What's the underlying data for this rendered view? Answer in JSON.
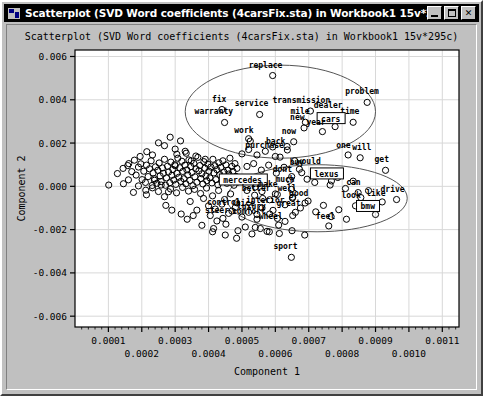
{
  "window": {
    "title": "Scatterplot (SVD Word coefficients (4carsFix.sta) in Workbook1 15v*295c)*",
    "icon": "statistica-graph-icon",
    "buttons": {
      "minimize": "minimize-button",
      "maximize": "maximize-button",
      "close_label": "✕"
    }
  },
  "chart_data": {
    "type": "scatter",
    "title": "Scatterplot (SVD Word coefficients (4carsFix.sta) in Workbook1 15v*295c)",
    "xlabel": "Component 1",
    "ylabel": "Component 2",
    "xlim": [
      0.0,
      0.00115
    ],
    "ylim": [
      -0.0065,
      0.0063
    ],
    "grid": true,
    "legend": "none",
    "xticks": [
      "0.0001",
      "0.0002",
      "0.0003",
      "0.0004",
      "0.0005",
      "0.0006",
      "0.0007",
      "0.0008",
      "0.0009",
      "0.0010",
      "0.0011"
    ],
    "xtick_values": [
      0.0001,
      0.0002,
      0.0003,
      0.0004,
      0.0005,
      0.0006,
      0.0007,
      0.0008,
      0.0009,
      0.001,
      0.0011
    ],
    "yticks": [
      "0.006",
      "0.004",
      "0.002",
      "0.000",
      "-0.002",
      "-0.004",
      "-0.006"
    ],
    "ytick_values": [
      0.006,
      0.004,
      0.002,
      0.0,
      -0.002,
      -0.004,
      -0.006
    ],
    "marker": "open-circle",
    "marker_color": "#000000",
    "plot_bg": "#ffffff",
    "annotations": {
      "ellipses": [
        {
          "name": "upper-ellipse",
          "cx": 0.000615,
          "cy": 0.00345,
          "rx": 0.000285,
          "ry": 0.00215,
          "rotation": 0
        },
        {
          "name": "lower-ellipse",
          "cx": 0.000725,
          "cy": -0.00055,
          "rx": 0.00027,
          "ry": 0.00155,
          "rotation": 0
        }
      ],
      "boxed_labels": [
        "cars",
        "lexus",
        "mercedes",
        "bmw"
      ]
    },
    "labeled_points": [
      {
        "label": "replace",
        "x": 0.000592,
        "y": 0.00512,
        "lx": -24,
        "ly": -8
      },
      {
        "label": "problem",
        "x": 0.000875,
        "y": 0.00388,
        "lx": -22,
        "ly": -8
      },
      {
        "label": "fix",
        "x": 0.00044,
        "y": 0.00355,
        "lx": -10,
        "ly": -8
      },
      {
        "label": "transmission",
        "x": 0.000705,
        "y": 0.00348,
        "lx": -38,
        "ly": -8
      },
      {
        "label": "service",
        "x": 0.000553,
        "y": 0.00332,
        "lx": -25,
        "ly": -8
      },
      {
        "label": "dealer",
        "x": 0.000775,
        "y": 0.00325,
        "lx": -20,
        "ly": -8
      },
      {
        "label": "warranty",
        "x": 0.000448,
        "y": 0.00295,
        "lx": -30,
        "ly": -8
      },
      {
        "label": "time",
        "x": 0.000833,
        "y": 0.00296,
        "lx": -13,
        "ly": -8
      },
      {
        "label": "mile",
        "x": 0.00069,
        "y": 0.00296,
        "lx": -15,
        "ly": -8
      },
      {
        "label": "new",
        "x": 0.000686,
        "y": 0.0027,
        "lx": -14,
        "ly": -8
      },
      {
        "label": "cars",
        "x": 0.000779,
        "y": 0.00276,
        "lx": -14,
        "ly": -5,
        "boxed": true
      },
      {
        "label": "year",
        "x": 0.000741,
        "y": 0.00253,
        "lx": -16,
        "ly": -7
      },
      {
        "label": "work",
        "x": 0.000525,
        "y": 0.00209,
        "lx": -16,
        "ly": -8
      },
      {
        "label": "now",
        "x": 0.000655,
        "y": 0.00206,
        "lx": -12,
        "ly": -8
      },
      {
        "label": "back",
        "x": 0.000635,
        "y": 0.00184,
        "lx": -21,
        "ly": -3
      },
      {
        "label": "one",
        "x": 0.000818,
        "y": 0.00145,
        "lx": -12,
        "ly": -7
      },
      {
        "label": "will",
        "x": 0.000854,
        "y": 0.00132,
        "lx": -8,
        "ly": -8
      },
      {
        "label": "purchase",
        "x": 0.0006,
        "y": 0.00138,
        "lx": -30,
        "ly": -8
      },
      {
        "label": "would",
        "x": 0.000718,
        "y": 0.00068,
        "lx": -18,
        "ly": -8
      },
      {
        "label": "buy",
        "x": 0.000679,
        "y": 0.00063,
        "lx": -12,
        "ly": -8
      },
      {
        "label": "get",
        "x": 0.00093,
        "y": 0.00074,
        "lx": -11,
        "ly": -8
      },
      {
        "label": "dont",
        "x": 0.000643,
        "y": 0.00028,
        "lx": -17,
        "ly": -8
      },
      {
        "label": "lexus",
        "x": 0.000768,
        "y": 0.00025,
        "lx": -17,
        "ly": -4,
        "boxed": true
      },
      {
        "label": "mercedes",
        "x": 0.00054,
        "y": -3e-05,
        "lx": -32,
        "ly": -4,
        "boxed": true
      },
      {
        "label": "much",
        "x": 0.000648,
        "y": -0.00014,
        "lx": -16,
        "ly": -7
      },
      {
        "label": "can",
        "x": 0.000848,
        "y": -0.00029,
        "lx": -12,
        "ly": -8
      },
      {
        "label": "make",
        "x": 0.0006,
        "y": -0.00035,
        "lx": -17,
        "ly": -7
      },
      {
        "label": "well",
        "x": 0.000651,
        "y": -0.00054,
        "lx": -15,
        "ly": -7
      },
      {
        "label": "better",
        "x": 0.000562,
        "y": -0.00056,
        "lx": -21,
        "ly": -7
      },
      {
        "label": "good",
        "x": 0.000689,
        "y": -0.00077,
        "lx": -16,
        "ly": -7
      },
      {
        "label": "look",
        "x": 0.00084,
        "y": -0.0009,
        "lx": -14,
        "ly": -8
      },
      {
        "label": "like",
        "x": 0.00092,
        "y": -0.00072,
        "lx": -16,
        "ly": -6
      },
      {
        "label": "drive",
        "x": 0.000963,
        "y": -0.00061,
        "lx": -16,
        "ly": -8
      },
      {
        "label": "interior",
        "x": 0.000593,
        "y": -0.00111,
        "lx": -27,
        "ly": -7
      },
      {
        "label": "great",
        "x": 0.00066,
        "y": -0.0012,
        "lx": -19,
        "ly": -6
      },
      {
        "label": "bmw",
        "x": 0.0009,
        "y": -0.0013,
        "lx": -15,
        "ly": -5,
        "boxed": true
      },
      {
        "label": "control",
        "x": 0.00047,
        "y": -0.00114,
        "lx": -25,
        "ly": -6
      },
      {
        "label": "nice",
        "x": 0.00052,
        "y": -0.0012,
        "lx": -13,
        "ly": -6
      },
      {
        "label": "luxury",
        "x": 0.000545,
        "y": -0.0013,
        "lx": -20,
        "ly": -5
      },
      {
        "label": "comfort",
        "x": 0.000545,
        "y": -0.00152,
        "lx": -25,
        "ly": -5
      },
      {
        "label": "steer",
        "x": 0.000443,
        "y": -0.00148,
        "lx": -18,
        "ly": -5
      },
      {
        "label": "wheel",
        "x": 0.00061,
        "y": -0.00179,
        "lx": -20,
        "ly": -6
      },
      {
        "label": "feel",
        "x": 0.00076,
        "y": -0.00183,
        "lx": -13,
        "ly": -7
      },
      {
        "label": "sport",
        "x": 0.000648,
        "y": -0.00328,
        "lx": -18,
        "ly": -8
      }
    ],
    "unlabeled_points": [
      [
        0.000101,
        6e-05
      ],
      [
        0.000158,
        0.00096
      ],
      [
        0.00017,
        0.00068
      ],
      [
        0.000183,
        0.00052
      ],
      [
        0.00019,
        0.00089
      ],
      [
        0.000197,
        0.00104
      ],
      [
        0.000201,
        0.00031
      ],
      [
        0.000206,
        0.0007
      ],
      [
        0.000211,
        0.00018
      ],
      [
        0.000214,
        0.00098
      ],
      [
        0.000219,
        0.00045
      ],
      [
        0.000223,
        0.00081
      ],
      [
        0.000228,
        0.00118
      ],
      [
        0.000231,
        4e-05
      ],
      [
        0.000234,
        0.00062
      ],
      [
        0.000238,
        0.00035
      ],
      [
        0.000241,
        0.0009
      ],
      [
        0.000245,
        0.00014
      ],
      [
        0.000248,
        0.00074
      ],
      [
        0.000252,
        0.00108
      ],
      [
        0.000255,
        0.00048
      ],
      [
        0.000258,
        0.00022
      ],
      [
        0.000262,
        0.00085
      ],
      [
        0.000265,
        0.0006
      ],
      [
        0.000268,
        0.00125
      ],
      [
        0.000271,
        5e-05
      ],
      [
        0.000274,
        0.00039
      ],
      [
        0.000277,
        0.00093
      ],
      [
        0.00028,
        0.00066
      ],
      [
        0.000284,
        0.00017
      ],
      [
        0.000287,
        0.00112
      ],
      [
        0.00029,
        0.00051
      ],
      [
        0.000293,
        0.00078
      ],
      [
        0.000296,
        0.00029
      ],
      [
        0.000299,
        0.001
      ],
      [
        0.000302,
        9e-05
      ],
      [
        0.000305,
        0.0006
      ],
      [
        0.000308,
        0.0013
      ],
      [
        0.000311,
        0.00042
      ],
      [
        0.000314,
        0.00086
      ],
      [
        0.000317,
        0.00023
      ],
      [
        0.00032,
        0.00116
      ],
      [
        0.000323,
        0.00069
      ],
      [
        0.000326,
        0.00035
      ],
      [
        0.000329,
        0.00098
      ],
      [
        0.000332,
        0.00012
      ],
      [
        0.000335,
        0.00076
      ],
      [
        0.000338,
        0.00053
      ],
      [
        0.000341,
        0.00122
      ],
      [
        0.000344,
        0.00027
      ],
      [
        0.000347,
        0.00091
      ],
      [
        0.00035,
        0.00064
      ],
      [
        0.000353,
        3e-05
      ],
      [
        0.000356,
        0.00106
      ],
      [
        0.000359,
        0.00044
      ],
      [
        0.000362,
        0.00081
      ],
      [
        0.000365,
        0.00019
      ],
      [
        0.000368,
        0.00134
      ],
      [
        0.000371,
        0.00072
      ],
      [
        0.000374,
        0.00096
      ],
      [
        0.000377,
        0.00036
      ],
      [
        0.00038,
        0.00058
      ],
      [
        0.000383,
        0.00011
      ],
      [
        0.000386,
        0.00114
      ],
      [
        0.000389,
        0.00084
      ],
      [
        0.000392,
        0.00048
      ],
      [
        0.000395,
        0.00026
      ],
      [
        0.000398,
        0.00102
      ],
      [
        0.000401,
        0.0007
      ],
      [
        0.000404,
        0.00039
      ],
      [
        0.000407,
        0.00089
      ],
      [
        0.00041,
        0.00016
      ],
      [
        0.000413,
        0.00125
      ],
      [
        0.000416,
        0.00062
      ],
      [
        0.000419,
        0.00095
      ],
      [
        0.000422,
        0.00031
      ],
      [
        0.000425,
        0.00077
      ],
      [
        0.000428,
        7e-05
      ],
      [
        0.000431,
        0.00109
      ],
      [
        0.000434,
        0.00054
      ],
      [
        0.000437,
        0.00088
      ],
      [
        0.00044,
        0.00023
      ],
      [
        0.000443,
        0.00118
      ],
      [
        0.000446,
        0.00066
      ],
      [
        0.000449,
        0.00042
      ],
      [
        0.000452,
        0.00099
      ],
      [
        0.000455,
        0.00014
      ],
      [
        0.000458,
        0.00075
      ],
      [
        0.000461,
        0.00057
      ],
      [
        0.000464,
        0.0013
      ],
      [
        0.000467,
        0.00034
      ],
      [
        0.00047,
        0.00092
      ],
      [
        0.000473,
        0.00069
      ],
      [
        0.000476,
        5e-05
      ],
      [
        0.000479,
        0.00105
      ],
      [
        0.000482,
        0.00046
      ],
      [
        0.000485,
        0.00083
      ],
      [
        0.000488,
        0.0002
      ],
      [
        0.00025,
        0.00201
      ],
      [
        0.000268,
        0.00188
      ],
      [
        0.000285,
        0.00227
      ],
      [
        0.0003,
        0.00172
      ],
      [
        0.000316,
        0.0021
      ],
      [
        0.000333,
        0.00153
      ],
      [
        0.000215,
        0.0016
      ],
      [
        0.000232,
        0.00145
      ],
      [
        0.000195,
        0.00138
      ],
      [
        0.000178,
        0.00121
      ],
      [
        0.000161,
        0.00105
      ],
      [
        0.000144,
        0.00083
      ],
      [
        0.000127,
        0.00059
      ],
      [
        0.00034,
        -0.00022
      ],
      [
        0.000358,
        -0.00014
      ],
      [
        0.000376,
        -0.00033
      ],
      [
        0.000394,
        -8e-05
      ],
      [
        0.000412,
        -0.00044
      ],
      [
        0.00043,
        -0.00019
      ],
      [
        0.000448,
        -0.00061
      ],
      [
        0.000466,
        -0.00035
      ],
      [
        0.000484,
        -0.00076
      ],
      [
        0.000322,
        -5e-05
      ],
      [
        0.000304,
        -0.0003
      ],
      [
        0.000286,
        -0.00012
      ],
      [
        0.000268,
        -0.00048
      ],
      [
        0.00025,
        -0.00024
      ],
      [
        0.000232,
        -7e-05
      ],
      [
        0.000214,
        -0.00039
      ],
      [
        0.0004,
        -0.0009
      ],
      [
        0.00042,
        -0.00105
      ],
      [
        0.00044,
        -0.00082
      ],
      [
        0.00046,
        -0.00125
      ],
      [
        0.00048,
        -0.00098
      ],
      [
        0.0005,
        -0.00142
      ],
      [
        0.000345,
        -0.0007
      ],
      [
        0.000365,
        -0.0011
      ],
      [
        0.000385,
        -0.00056
      ],
      [
        0.000405,
        -0.00135
      ],
      [
        0.000425,
        -0.0016
      ],
      [
        0.00038,
        -0.0018
      ],
      [
        0.000415,
        -0.00195
      ],
      [
        0.000452,
        -0.00175
      ],
      [
        0.000488,
        -0.00205
      ],
      [
        0.00051,
        -0.00188
      ],
      [
        0.00053,
        -0.0022
      ],
      [
        0.000555,
        -0.00195
      ],
      [
        0.000582,
        -0.0021
      ],
      [
        0.0005,
        0.0015
      ],
      [
        0.00052,
        0.0017
      ],
      [
        0.000545,
        0.00145
      ],
      [
        0.00057,
        0.00162
      ],
      [
        0.000592,
        0.00182
      ],
      [
        0.000614,
        0.00135
      ],
      [
        0.000636,
        0.00168
      ],
      [
        0.000658,
        0.00118
      ],
      [
        0.0003,
        0.00095
      ],
      [
        0.000515,
        0.00092
      ],
      [
        0.000535,
        0.00105
      ],
      [
        0.000558,
        0.00075
      ],
      [
        0.00058,
        0.00098
      ],
      [
        0.000603,
        0.00061
      ],
      [
        0.000626,
        0.00088
      ],
      [
        0.000649,
        0.00045
      ],
      [
        0.000672,
        0.00079
      ],
      [
        0.000695,
        0.00033
      ],
      [
        0.000718,
        0.00018
      ],
      [
        0.000741,
        0.00052
      ],
      [
        0.000764,
        6e-05
      ],
      [
        0.000787,
        0.00041
      ],
      [
        0.00081,
        -0.0001
      ],
      [
        0.000833,
        0.00024
      ],
      [
        0.000856,
        -0.00052
      ],
      [
        0.000879,
        -0.0002
      ],
      [
        0.000515,
        -0.00019
      ],
      [
        0.000538,
        -0.00041
      ],
      [
        0.00056,
        -0.00024
      ],
      [
        0.000583,
        -0.00062
      ],
      [
        0.000606,
        -0.00038
      ],
      [
        0.000629,
        -0.00085
      ],
      [
        0.000652,
        -0.0005
      ],
      [
        0.000675,
        -0.001
      ],
      [
        0.000698,
        -0.00068
      ],
      [
        0.000721,
        -0.00118
      ],
      [
        0.000744,
        -0.00088
      ],
      [
        0.000767,
        -0.0014
      ],
      [
        0.00079,
        -0.00108
      ],
      [
        0.000813,
        -0.00152
      ],
      [
        0.00056,
        -0.001
      ],
      [
        0.000583,
        -0.00128
      ],
      [
        0.000606,
        -0.00148
      ],
      [
        0.000629,
        -0.00162
      ],
      [
        0.000652,
        -0.00135
      ],
      [
        0.00054,
        -0.0019
      ],
      [
        0.000575,
        -0.00208
      ],
      [
        0.000612,
        -0.00218
      ],
      [
        0.00065,
        -0.00205
      ],
      [
        0.000688,
        -0.00225
      ],
      [
        0.00045,
        -0.00225
      ],
      [
        0.000484,
        -0.0024
      ],
      [
        0.000412,
        -0.0021
      ],
      [
        0.000318,
        -0.00128
      ],
      [
        0.000336,
        -0.00152
      ],
      [
        0.000354,
        -0.00135
      ],
      [
        0.00029,
        -0.0011
      ],
      [
        0.000272,
        -0.00088
      ],
      [
        0.00019,
        2e-05
      ],
      [
        0.000212,
        -0.00018
      ],
      [
        0.000175,
        -0.00028
      ],
      [
        0.00016,
        0.0003
      ],
      [
        0.000145,
        0.00012
      ],
      [
        0.000238,
        0.00028
      ],
      [
        0.000258,
        6e-05
      ],
      [
        0.00028,
        -0.00025
      ],
      [
        0.00052,
        0.0022
      ],
      [
        0.000362,
        0.0014
      ],
      [
        0.00039,
        0.00125
      ],
      [
        0.000348,
        0.00118
      ],
      [
        0.000305,
        0.00148
      ],
      [
        0.00033,
        0.00162
      ]
    ]
  }
}
